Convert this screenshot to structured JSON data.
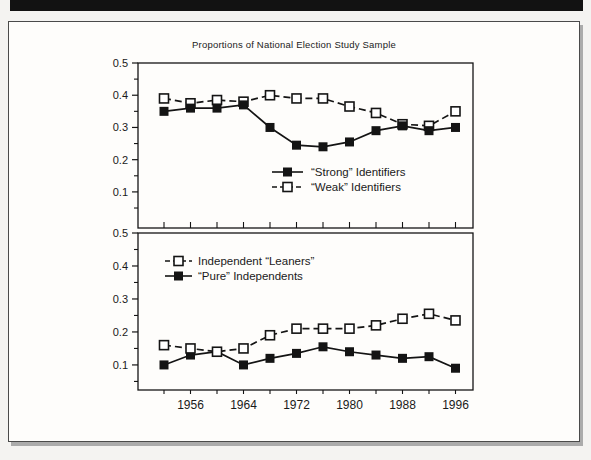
{
  "title": "Proportions of National Election Study Sample",
  "colors": {
    "ink": "#141414",
    "banner": "#121212",
    "page_background": "#fefdfb",
    "page_border": "#4a4a4a",
    "shadow": "#ababab"
  },
  "chart_data": [
    {
      "type": "line",
      "panel": "top",
      "title": "Proportions of National Election Study Sample",
      "x": [
        1952,
        1956,
        1960,
        1964,
        1968,
        1972,
        1976,
        1980,
        1984,
        1988,
        1992,
        1996
      ],
      "x_tick_labels": [],
      "y_ticks": [
        0.1,
        0.2,
        0.3,
        0.4,
        0.5
      ],
      "y_tick_labels": [
        "0.1",
        "0.2",
        "0.3",
        "0.4",
        "0.5"
      ],
      "y_minor_ticks": [
        0.05,
        0.15,
        0.25,
        0.35,
        0.45
      ],
      "ylim": [
        0,
        0.5
      ],
      "grid": false,
      "legend_position": "inside lower-center",
      "series": [
        {
          "name": "“Strong” Identifiers",
          "marker": "filled-square",
          "line_style": "solid",
          "values": [
            0.35,
            0.36,
            0.36,
            0.37,
            0.3,
            0.245,
            0.24,
            0.255,
            0.29,
            0.305,
            0.29,
            0.3
          ]
        },
        {
          "name": "“Weak” Identifiers",
          "marker": "open-square",
          "line_style": "dashed",
          "values": [
            0.39,
            0.375,
            0.385,
            0.38,
            0.4,
            0.39,
            0.39,
            0.365,
            0.345,
            0.31,
            0.305,
            0.35
          ]
        }
      ]
    },
    {
      "type": "line",
      "panel": "bottom",
      "title": "",
      "x": [
        1952,
        1956,
        1960,
        1964,
        1968,
        1972,
        1976,
        1980,
        1984,
        1988,
        1992,
        1996
      ],
      "x_tick_labels": [
        "1956",
        "1964",
        "1972",
        "1980",
        "1988",
        "1996"
      ],
      "y_ticks": [
        0.1,
        0.2,
        0.3,
        0.4,
        0.5
      ],
      "y_tick_labels": [
        "0.1",
        "0.2",
        "0.3",
        "0.4",
        "0.5"
      ],
      "y_minor_ticks": [
        0.05,
        0.15,
        0.25,
        0.35,
        0.45
      ],
      "ylim": [
        0,
        0.5
      ],
      "grid": false,
      "legend_position": "inside upper-left",
      "series": [
        {
          "name": "Independent “Leaners”",
          "marker": "open-square",
          "line_style": "dashed",
          "values": [
            0.16,
            0.15,
            0.14,
            0.15,
            0.19,
            0.21,
            0.21,
            0.21,
            0.22,
            0.24,
            0.255,
            0.235
          ]
        },
        {
          "name": "“Pure” Independents",
          "marker": "filled-square",
          "line_style": "solid",
          "values": [
            0.1,
            0.13,
            0.14,
            0.1,
            0.12,
            0.135,
            0.155,
            0.14,
            0.13,
            0.12,
            0.125,
            0.09
          ]
        }
      ]
    }
  ]
}
